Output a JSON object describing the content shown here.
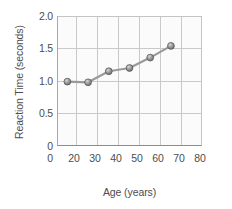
{
  "chart_data": {
    "type": "line",
    "title": "",
    "xlabel": "Age (years)",
    "ylabel": "Reaction Time (seconds)",
    "xlim": [
      20,
      90
    ],
    "ylim": [
      0,
      2.0
    ],
    "grid": true,
    "legend": "none",
    "x": [
      25,
      35,
      45,
      55,
      65,
      75
    ],
    "values": [
      0.99,
      0.98,
      1.15,
      1.2,
      1.36,
      1.54
    ],
    "series": [
      {
        "name": "Reaction Time",
        "x": [
          25,
          35,
          45,
          55,
          65,
          75
        ],
        "values": [
          0.99,
          0.98,
          1.15,
          1.2,
          1.36,
          1.54
        ],
        "marker": "circle",
        "color": "#8a8a8a"
      }
    ],
    "xticks": [
      {
        "label": "0",
        "value": 0
      },
      {
        "label": "20",
        "value": 20
      },
      {
        "label": "30",
        "value": 30
      },
      {
        "label": "40",
        "value": 40
      },
      {
        "label": "50",
        "value": 50
      },
      {
        "label": "60",
        "value": 60
      },
      {
        "label": "70",
        "value": 70
      },
      {
        "label": "80",
        "value": 80
      }
    ],
    "yticks": [
      {
        "label": "2.0",
        "value": 2.0
      },
      {
        "label": "1.5",
        "value": 1.5
      },
      {
        "label": "1.0",
        "value": 1.0
      },
      {
        "label": "0.5",
        "value": 0.5
      },
      {
        "label": "0",
        "value": 0
      }
    ],
    "colors": {
      "line": "#9a9a9a",
      "marker_fill": "#8f8f8f",
      "marker_edge": "#5a5a5a",
      "grid": "#c9c9c9",
      "axis": "#8d8d8d",
      "plot_background": "#fbfbfb",
      "text": "#4d4d4d"
    }
  },
  "axes": {
    "y_title": "Reaction Time (seconds)",
    "x_title": "Age (years)",
    "ytick_0": "2.0",
    "ytick_1": "1.5",
    "ytick_2": "1.0",
    "ytick_3": "0.5",
    "ytick_4": "0",
    "xtick_0": "0",
    "xtick_1": "20",
    "xtick_2": "30",
    "xtick_3": "40",
    "xtick_4": "50",
    "xtick_5": "60",
    "xtick_6": "70",
    "xtick_7": "80"
  }
}
